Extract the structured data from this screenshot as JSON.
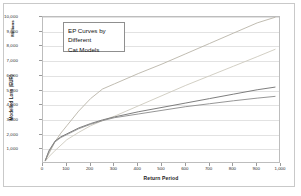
{
  "chart_data": {
    "type": "line",
    "title": "",
    "annotation": {
      "lines": [
        "EP Curves by",
        "Different",
        "Cat Models"
      ]
    },
    "xlabel": "Return Period",
    "ylabel": "Modelled Loss (EUR)",
    "yunit": "Millions",
    "xlim": [
      0,
      1000
    ],
    "ylim": [
      0,
      10000
    ],
    "xticks": [
      "0",
      "100",
      "200",
      "300",
      "400",
      "500",
      "600",
      "700",
      "800",
      "900",
      "1,000"
    ],
    "xtick_values": [
      0,
      100,
      200,
      300,
      400,
      500,
      600,
      700,
      800,
      900,
      1000
    ],
    "yticks": [
      "1,000",
      "2,000",
      "3,000",
      "4,000",
      "5,000",
      "6,000",
      "7,000",
      "8,000",
      "9,000",
      "10,000"
    ],
    "ytick_values": [
      1000,
      2000,
      3000,
      4000,
      5000,
      6000,
      7000,
      8000,
      9000,
      10000
    ],
    "grid": "horizontal",
    "legend": "none",
    "series": [
      {
        "name": "Model A",
        "color": "#b9b4a8",
        "x": [
          10,
          25,
          50,
          75,
          100,
          150,
          200,
          250,
          300,
          400,
          500,
          600,
          700,
          800,
          900,
          975
        ],
        "values": [
          250,
          700,
          1500,
          2100,
          2600,
          3600,
          4450,
          5100,
          5450,
          6150,
          6800,
          7500,
          8200,
          8900,
          9600,
          9980
        ]
      },
      {
        "name": "Model B",
        "color": "#cdc9bd",
        "x": [
          10,
          25,
          50,
          100,
          150,
          200,
          250,
          300,
          350,
          400,
          500,
          600,
          700,
          800,
          900,
          975
        ],
        "values": [
          200,
          500,
          900,
          1650,
          2150,
          2600,
          2950,
          3250,
          3600,
          3950,
          4650,
          5350,
          6000,
          6650,
          7300,
          7800
        ]
      },
      {
        "name": "Model C",
        "color": "#6f6f6f",
        "x": [
          10,
          25,
          50,
          75,
          100,
          150,
          200,
          250,
          300,
          400,
          500,
          600,
          700,
          800,
          900,
          975
        ],
        "values": [
          250,
          900,
          1550,
          1850,
          2050,
          2450,
          2750,
          3000,
          3200,
          3550,
          3850,
          4150,
          4450,
          4750,
          5050,
          5230
        ]
      },
      {
        "name": "Model D",
        "color": "#8a8a8a",
        "x": [
          10,
          25,
          50,
          75,
          100,
          150,
          200,
          250,
          300,
          400,
          500,
          600,
          700,
          800,
          900,
          975
        ],
        "values": [
          250,
          850,
          1500,
          1800,
          2000,
          2400,
          2700,
          2950,
          3150,
          3400,
          3650,
          3900,
          4100,
          4300,
          4480,
          4600
        ]
      }
    ]
  }
}
